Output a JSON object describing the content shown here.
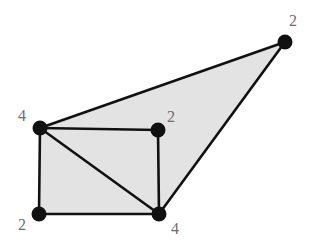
{
  "figure": {
    "title": "",
    "background_color": "#ffffff",
    "width": 309,
    "height": 241
  },
  "style": {
    "fill_color": "#e3e3e3",
    "edge_color": "#111111",
    "node_color": "#111111",
    "label_color": "#6e6e6e",
    "edge_width": 2.6,
    "node_radius": 7.5,
    "label_font_size": 16
  },
  "chart_data": {
    "type": "diagram",
    "subtype": "planar-graph-node-degree",
    "title": "",
    "xlabel": "",
    "ylabel": "",
    "grid": false,
    "legend": null,
    "xlim": [
      0,
      309
    ],
    "ylim": [
      241,
      0
    ],
    "nodes": [
      {
        "id": "top_right",
        "label": "2",
        "x": 285,
        "y": 42,
        "label_x": 293,
        "label_y": 26,
        "label_anchor": "middle"
      },
      {
        "id": "left_upper",
        "label": "4",
        "x": 40,
        "y": 128,
        "label_x": 22,
        "label_y": 121,
        "label_anchor": "middle"
      },
      {
        "id": "middle",
        "label": "2",
        "x": 158,
        "y": 130,
        "label_x": 171,
        "label_y": 122,
        "label_anchor": "middle"
      },
      {
        "id": "bottom_left",
        "label": "2",
        "x": 39,
        "y": 214,
        "label_x": 22,
        "label_y": 230,
        "label_anchor": "middle"
      },
      {
        "id": "bottom_middle",
        "label": "4",
        "x": 159,
        "y": 214,
        "label_x": 175,
        "label_y": 234,
        "label_anchor": "middle"
      }
    ],
    "edges": [
      {
        "from": "left_upper",
        "to": "top_right"
      },
      {
        "from": "top_right",
        "to": "bottom_middle"
      },
      {
        "from": "left_upper",
        "to": "middle"
      },
      {
        "from": "left_upper",
        "to": "bottom_left"
      },
      {
        "from": "left_upper",
        "to": "bottom_middle"
      },
      {
        "from": "middle",
        "to": "bottom_middle"
      },
      {
        "from": "bottom_left",
        "to": "bottom_middle"
      }
    ],
    "filled_regions": [
      {
        "id": "outer-hull",
        "points": "40,128 285,42 159,214 39,214",
        "color": "#e3e3e3"
      }
    ],
    "node_labels": [
      "2",
      "4",
      "2",
      "2",
      "4"
    ],
    "node_degrees": [
      2,
      4,
      2,
      2,
      4
    ]
  }
}
